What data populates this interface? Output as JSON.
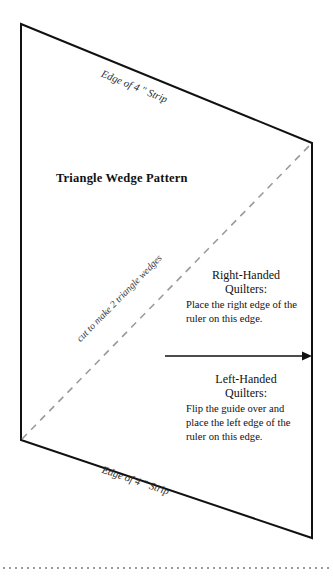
{
  "document": {
    "title": "Triangle Wedge Pattern"
  },
  "figure": {
    "title": "Triangle Wedge Pattern",
    "edge_label_top": "Edge of 4 \" Strip",
    "edge_label_bottom": "Edge of 4 \" Strip",
    "cut_line_label": "cut to make 2 triangle wedges",
    "outline_color": "#111111",
    "cut_line_color": "#999999",
    "footer_rule_color": "#9a9a9a",
    "arrow_color": "#111111"
  },
  "instructions": {
    "right_handed": {
      "heading_line_1": "Right-Handed",
      "heading_line_2": "Quilters:",
      "body": "Place the right edge of the ruler on this edge."
    },
    "left_handed": {
      "heading_line_1": "Left-Handed",
      "heading_line_2": "Quilters:",
      "body": "Flip the guide over and place the left edge of the ruler on this edge."
    }
  }
}
